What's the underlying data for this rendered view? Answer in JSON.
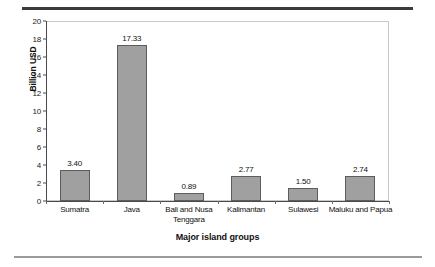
{
  "chart_data": {
    "type": "bar",
    "title": "",
    "xlabel": "Major island groups",
    "ylabel": "Billion USD",
    "categories": [
      "Sumatra",
      "Java",
      "Bali and Nusa Tenggara",
      "Kalimantan",
      "Sulawesi",
      "Maluku and Papua"
    ],
    "values": [
      3.4,
      17.33,
      0.89,
      2.77,
      1.5,
      2.74
    ],
    "value_labels": [
      "3.40",
      "17.33",
      "0.89",
      "2.77",
      "1.50",
      "2.74"
    ],
    "ylim": [
      0,
      20
    ],
    "yticks": [
      0,
      2,
      4,
      6,
      8,
      10,
      12,
      14,
      16,
      18,
      20
    ],
    "ytick_labels": [
      "0",
      "2",
      "4",
      "6",
      "8",
      "10",
      "12",
      "14",
      "16",
      "18",
      "20"
    ],
    "grid": false,
    "legend": false,
    "bar_color": "#a0a0a0",
    "bar_edge_color": "#5d5d5d",
    "axis_color": "#4a4a4a"
  }
}
